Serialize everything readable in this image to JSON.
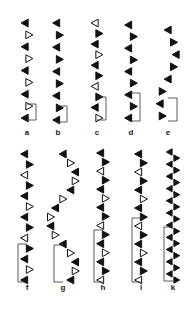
{
  "figure": {
    "ink_color": "#111111",
    "open_fill": "#ffffff",
    "panels": [
      {
        "label": "a",
        "x": 27,
        "top": 23,
        "bottom": 118,
        "tets": 9,
        "amp": 4,
        "period": 2,
        "style": "alt-open",
        "repeat": {
          "top": 104,
          "bottom": 120
        }
      },
      {
        "label": "b",
        "x": 58,
        "top": 23,
        "bottom": 120,
        "tets": 9,
        "amp": 3,
        "period": 2,
        "style": "solid",
        "repeat": {
          "top": 106,
          "bottom": 122
        }
      },
      {
        "label": "c",
        "x": 97,
        "top": 23,
        "bottom": 118,
        "tets": 10,
        "amp": 4,
        "period": 3,
        "style": "every3-open",
        "repeat": {
          "top": 97,
          "bottom": 120
        }
      },
      {
        "label": "d",
        "x": 131,
        "top": 25,
        "bottom": 118,
        "tets": 9,
        "amp": 5,
        "period": 2,
        "style": "solid",
        "repeat": {
          "top": 93,
          "bottom": 121
        }
      },
      {
        "label": "e",
        "x": 168,
        "top": 30,
        "bottom": 116,
        "tets": 8,
        "amp": 8,
        "period": 4,
        "style": "zig-solid",
        "repeat": {
          "top": 98,
          "bottom": 121
        }
      },
      {
        "label": "f",
        "x": 27,
        "top": 154,
        "bottom": 280,
        "tets": 13,
        "amp": 5,
        "period": 7,
        "style": "mixed",
        "repeat": {
          "top": 244,
          "bottom": 282
        }
      },
      {
        "label": "g",
        "x": 63,
        "top": 154,
        "bottom": 280,
        "tets": 15,
        "amp": 13,
        "period": 5,
        "style": "g-mixed",
        "repeat": {
          "top": 245,
          "bottom": 282
        }
      },
      {
        "label": "h",
        "x": 103,
        "top": 153,
        "bottom": 280,
        "tets": 15,
        "amp": 5,
        "period": 5,
        "style": "mixed",
        "repeat": {
          "top": 230,
          "bottom": 282
        }
      },
      {
        "label": "i",
        "x": 141,
        "top": 154,
        "bottom": 280,
        "tets": 15,
        "amp": 5,
        "period": 7,
        "style": "mixed",
        "repeat": {
          "top": 218,
          "bottom": 282
        }
      },
      {
        "label": "k",
        "x": 173,
        "top": 152,
        "bottom": 280,
        "tets": 22,
        "amp": 7,
        "period": 2,
        "style": "solid",
        "repeat": {
          "top": 227,
          "bottom": 281
        }
      }
    ],
    "labels_row1_y": 128,
    "labels_row2_y": 283
  }
}
